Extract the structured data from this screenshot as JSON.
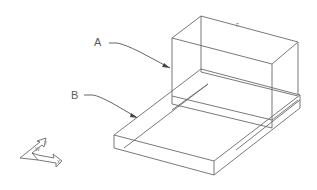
{
  "diagram": {
    "type": "isometric-wireframe",
    "labels": {
      "A": "A",
      "B": "B"
    },
    "top_edge_mark": "F",
    "triad": {
      "axis_labels": [
        "W",
        "Y",
        "X"
      ]
    },
    "colors": {
      "line": "#6a6a6a",
      "label": "#5a5a5a",
      "background": "#ffffff"
    }
  }
}
